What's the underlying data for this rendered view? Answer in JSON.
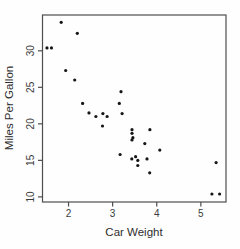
{
  "chart_data": {
    "type": "scatter",
    "title": "",
    "xlabel": "Car Weight",
    "ylabel": "Miles Per Gallon",
    "points": [
      {
        "x": 2.62,
        "y": 21.0
      },
      {
        "x": 2.875,
        "y": 21.0
      },
      {
        "x": 2.32,
        "y": 22.8
      },
      {
        "x": 3.215,
        "y": 21.4
      },
      {
        "x": 3.44,
        "y": 18.7
      },
      {
        "x": 3.46,
        "y": 18.1
      },
      {
        "x": 3.57,
        "y": 14.3
      },
      {
        "x": 3.19,
        "y": 24.4
      },
      {
        "x": 3.15,
        "y": 22.8
      },
      {
        "x": 3.44,
        "y": 19.2
      },
      {
        "x": 3.44,
        "y": 17.8
      },
      {
        "x": 4.07,
        "y": 16.4
      },
      {
        "x": 3.73,
        "y": 17.3
      },
      {
        "x": 3.78,
        "y": 15.2
      },
      {
        "x": 5.25,
        "y": 10.4
      },
      {
        "x": 5.424,
        "y": 10.4
      },
      {
        "x": 5.345,
        "y": 14.7
      },
      {
        "x": 2.2,
        "y": 32.4
      },
      {
        "x": 1.615,
        "y": 30.4
      },
      {
        "x": 1.835,
        "y": 33.9
      },
      {
        "x": 2.465,
        "y": 21.5
      },
      {
        "x": 3.52,
        "y": 15.5
      },
      {
        "x": 3.435,
        "y": 15.2
      },
      {
        "x": 3.84,
        "y": 13.3
      },
      {
        "x": 3.845,
        "y": 19.2
      },
      {
        "x": 1.935,
        "y": 27.3
      },
      {
        "x": 2.14,
        "y": 26.0
      },
      {
        "x": 1.513,
        "y": 30.4
      },
      {
        "x": 3.17,
        "y": 15.8
      },
      {
        "x": 2.77,
        "y": 19.7
      },
      {
        "x": 3.57,
        "y": 15.0
      },
      {
        "x": 2.78,
        "y": 21.4
      }
    ],
    "x_ticks": [
      2,
      3,
      4,
      5
    ],
    "y_ticks": [
      10,
      15,
      20,
      25,
      30
    ],
    "xlim": [
      1.41,
      5.57
    ],
    "ylim": [
      9.3,
      34.9
    ],
    "grid": false,
    "legend": "none",
    "marker": "filled-circle",
    "point_color": "#161616",
    "axis_color": "#4d4d4d",
    "text_color": "#3b3b3b",
    "background": "#fefefe"
  }
}
